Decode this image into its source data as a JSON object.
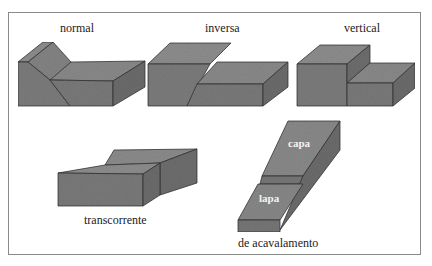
{
  "figure": {
    "colors": {
      "rock_top": "#8c8c8c",
      "rock_front": "#7a7a7a",
      "rock_side": "#6e6e6e",
      "edge": "#333333",
      "frame": "#8a8a8a"
    },
    "panels": [
      {
        "id": "normal",
        "label": "normal"
      },
      {
        "id": "inversa",
        "label": "inversa"
      },
      {
        "id": "vertical",
        "label": "vertical"
      },
      {
        "id": "transcorrente",
        "label": "transcorrente"
      },
      {
        "id": "acavalamento",
        "label": "de acavalamento",
        "block_labels": {
          "upper": "capa",
          "lower": "lapa"
        }
      }
    ]
  }
}
